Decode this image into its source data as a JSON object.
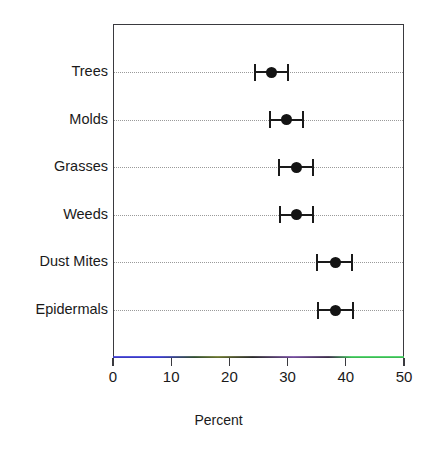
{
  "chart_data": {
    "type": "scatter",
    "title": "",
    "xlabel": "Percent",
    "ylabel": "",
    "xlim": [
      0,
      50
    ],
    "xticks": [
      0,
      10,
      20,
      30,
      40,
      50
    ],
    "xtick_labels": [
      "0",
      "10",
      "20",
      "30",
      "40",
      "50"
    ],
    "grid": "horizontal-dotted",
    "legend": "none",
    "categories": [
      "Trees",
      "Molds",
      "Grasses",
      "Weeds",
      "Dust Mites",
      "Epidermals"
    ],
    "values": [
      27.0,
      29.7,
      31.3,
      31.3,
      38.0,
      38.1
    ],
    "error_low": [
      24.2,
      26.8,
      28.3,
      28.5,
      34.9,
      35.1
    ],
    "error_high": [
      29.9,
      32.5,
      34.2,
      34.2,
      40.9,
      41.1
    ],
    "points": [
      {
        "label": "Trees",
        "value": 27.0,
        "low": 24.2,
        "high": 29.9
      },
      {
        "label": "Molds",
        "value": 29.7,
        "low": 26.8,
        "high": 32.5
      },
      {
        "label": "Grasses",
        "value": 31.3,
        "low": 28.3,
        "high": 34.2
      },
      {
        "label": "Weeds",
        "value": 31.3,
        "low": 28.5,
        "high": 34.2
      },
      {
        "label": "Dust Mites",
        "value": 38.0,
        "low": 34.9,
        "high": 40.9
      },
      {
        "label": "Epidermals",
        "value": 38.1,
        "low": 35.1,
        "high": 41.1
      }
    ],
    "colors": {
      "point": "#141414",
      "error_bar": "#1a1a1a",
      "grid": "#9a9a9a",
      "frame": "#3a3a3f",
      "text": "#1a1a1a",
      "background": "#ffffff"
    }
  },
  "axis": {
    "x_title": "Percent",
    "tick_labels": [
      "0",
      "10",
      "20",
      "30",
      "40",
      "50"
    ]
  },
  "category_labels": [
    "Trees",
    "Molds",
    "Grasses",
    "Weeds",
    "Dust Mites",
    "Epidermals"
  ]
}
